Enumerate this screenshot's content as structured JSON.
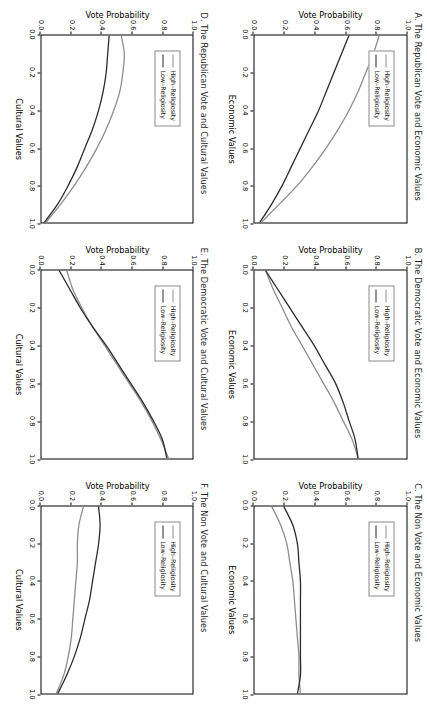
{
  "figure": {
    "orientation": "rotated-90-clockwise",
    "colors": {
      "high_religiosity": "#8d8d8d",
      "low_religiosity": "#2b2b2b",
      "axis": "#000000",
      "background": "#ffffff"
    },
    "legend": {
      "high_label": "High–Religiosity",
      "low_label": "Low–Religiosity"
    },
    "axis": {
      "y_label": "Vote Probability",
      "y_ticks": [
        "0.0",
        "0.2",
        "0.4",
        "0.6",
        "0.8",
        "1.0"
      ],
      "x_ticks": [
        "0.0",
        "0.2",
        "0.4",
        "0.6",
        "0.8",
        "1.0"
      ],
      "x_label_economic": "Economic Values",
      "x_label_cultural": "Cultural Values"
    }
  },
  "chart_data": [
    {
      "id": "A",
      "type": "line",
      "title": "A. The Republican Vote and Economic Values",
      "xlabel": "Economic Values",
      "ylabel": "Vote Probability",
      "xlim": [
        0.0,
        1.0
      ],
      "ylim": [
        0.0,
        1.0
      ],
      "grid": false,
      "legend_position": "top-left",
      "x": [
        0.0,
        0.1,
        0.2,
        0.3,
        0.4,
        0.5,
        0.6,
        0.7,
        0.8,
        0.9,
        1.0
      ],
      "series": [
        {
          "name": "High–Religiosity",
          "color": "#8d8d8d",
          "values": [
            0.82,
            0.78,
            0.73,
            0.68,
            0.62,
            0.55,
            0.47,
            0.38,
            0.28,
            0.16,
            0.04
          ]
        },
        {
          "name": "Low–Religiosity",
          "color": "#2b2b2b",
          "values": [
            0.62,
            0.57,
            0.52,
            0.47,
            0.42,
            0.36,
            0.3,
            0.24,
            0.18,
            0.11,
            0.03
          ]
        }
      ]
    },
    {
      "id": "B",
      "type": "line",
      "title": "B. The Democratic Vote and Economic Values",
      "xlabel": "Economic Values",
      "ylabel": "Vote Probability",
      "xlim": [
        0.0,
        1.0
      ],
      "ylim": [
        0.0,
        1.0
      ],
      "grid": false,
      "legend_position": "top-left",
      "x": [
        0.0,
        0.1,
        0.2,
        0.3,
        0.4,
        0.5,
        0.6,
        0.7,
        0.8,
        0.9,
        1.0
      ],
      "series": [
        {
          "name": "High–Religiosity",
          "color": "#8d8d8d",
          "values": [
            0.07,
            0.12,
            0.18,
            0.24,
            0.31,
            0.38,
            0.45,
            0.52,
            0.58,
            0.64,
            0.68
          ]
        },
        {
          "name": "Low–Religiosity",
          "color": "#2b2b2b",
          "values": [
            0.07,
            0.15,
            0.23,
            0.31,
            0.39,
            0.46,
            0.53,
            0.58,
            0.62,
            0.66,
            0.68
          ]
        }
      ]
    },
    {
      "id": "C",
      "type": "line",
      "title": "C. The Non Vote and Economic Values",
      "xlabel": "Economic Values",
      "ylabel": "Vote Probability",
      "xlim": [
        0.0,
        1.0
      ],
      "ylim": [
        0.0,
        1.0
      ],
      "grid": false,
      "legend_position": "top-left",
      "x": [
        0.0,
        0.1,
        0.2,
        0.3,
        0.4,
        0.5,
        0.6,
        0.7,
        0.8,
        0.9,
        1.0
      ],
      "series": [
        {
          "name": "High–Religiosity",
          "color": "#8d8d8d",
          "values": [
            0.11,
            0.17,
            0.21,
            0.23,
            0.25,
            0.26,
            0.27,
            0.28,
            0.29,
            0.29,
            0.3
          ]
        },
        {
          "name": "Low–Religiosity",
          "color": "#2b2b2b",
          "values": [
            0.19,
            0.25,
            0.28,
            0.29,
            0.3,
            0.3,
            0.3,
            0.3,
            0.3,
            0.3,
            0.28
          ]
        }
      ]
    },
    {
      "id": "D",
      "type": "line",
      "title": "D. The Republican Vote and Cultural Values",
      "xlabel": "Cultural Values",
      "ylabel": "Vote Probability",
      "xlim": [
        0.0,
        1.0
      ],
      "ylim": [
        0.0,
        1.0
      ],
      "grid": false,
      "legend_position": "top-left",
      "x": [
        0.0,
        0.1,
        0.2,
        0.3,
        0.4,
        0.5,
        0.6,
        0.7,
        0.8,
        0.9,
        1.0
      ],
      "series": [
        {
          "name": "High–Religiosity",
          "color": "#8d8d8d",
          "values": [
            0.53,
            0.55,
            0.54,
            0.52,
            0.48,
            0.43,
            0.37,
            0.3,
            0.22,
            0.13,
            0.03
          ]
        },
        {
          "name": "Low–Religiosity",
          "color": "#2b2b2b",
          "values": [
            0.45,
            0.44,
            0.43,
            0.41,
            0.38,
            0.34,
            0.29,
            0.24,
            0.18,
            0.11,
            0.02
          ]
        }
      ]
    },
    {
      "id": "E",
      "type": "line",
      "title": "E. The Democratic Vote and Cultural Values",
      "xlabel": "Cultural Values",
      "ylabel": "Vote Probability",
      "xlim": [
        0.0,
        1.0
      ],
      "ylim": [
        0.0,
        1.0
      ],
      "grid": false,
      "legend_position": "top-left",
      "x": [
        0.0,
        0.1,
        0.2,
        0.3,
        0.4,
        0.5,
        0.6,
        0.7,
        0.8,
        0.9,
        1.0
      ],
      "series": [
        {
          "name": "High–Religiosity",
          "color": "#8d8d8d",
          "values": [
            0.17,
            0.21,
            0.27,
            0.34,
            0.42,
            0.5,
            0.58,
            0.66,
            0.73,
            0.79,
            0.84
          ]
        },
        {
          "name": "Low–Religiosity",
          "color": "#2b2b2b",
          "values": [
            0.12,
            0.19,
            0.26,
            0.34,
            0.43,
            0.51,
            0.59,
            0.67,
            0.74,
            0.8,
            0.83
          ]
        }
      ]
    },
    {
      "id": "F",
      "type": "line",
      "title": "F. The Non Vote and Cultural Values",
      "xlabel": "Cultural Values",
      "ylabel": "Vote Probability",
      "xlim": [
        0.0,
        1.0
      ],
      "ylim": [
        0.0,
        1.0
      ],
      "grid": false,
      "legend_position": "top-left",
      "x": [
        0.0,
        0.1,
        0.2,
        0.3,
        0.4,
        0.5,
        0.6,
        0.7,
        0.8,
        0.9,
        1.0
      ],
      "series": [
        {
          "name": "High–Religiosity",
          "color": "#8d8d8d",
          "values": [
            0.28,
            0.25,
            0.24,
            0.24,
            0.23,
            0.22,
            0.21,
            0.2,
            0.18,
            0.15,
            0.1
          ]
        },
        {
          "name": "Low–Religiosity",
          "color": "#2b2b2b",
          "values": [
            0.38,
            0.39,
            0.38,
            0.36,
            0.34,
            0.32,
            0.29,
            0.26,
            0.22,
            0.17,
            0.11
          ]
        }
      ]
    }
  ]
}
